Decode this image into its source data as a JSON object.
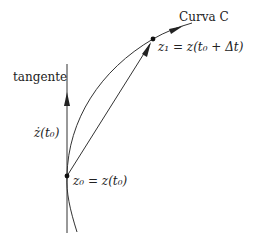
{
  "diagram": {
    "labels": {
      "curve": "Curva C",
      "z1": "z₁ = z(t₀ + Δt)",
      "tangent": "tangente",
      "zdot": "ż(t₀)",
      "z0": "z₀ = z(t₀)"
    },
    "points": [
      {
        "name": "z0",
        "x": 67,
        "y": 176
      },
      {
        "name": "z1",
        "x": 153,
        "y": 39
      }
    ],
    "colors": {
      "stroke": "#333333",
      "background": "#ffffff",
      "text": "#222222"
    },
    "elements": [
      {
        "type": "curve",
        "label": "Curva C",
        "direction": "upward-right"
      },
      {
        "type": "tangent-line",
        "label": "tangente",
        "vector": "ż(t₀)"
      },
      {
        "type": "secant-vector",
        "from": "z0",
        "to": "z1"
      }
    ]
  }
}
